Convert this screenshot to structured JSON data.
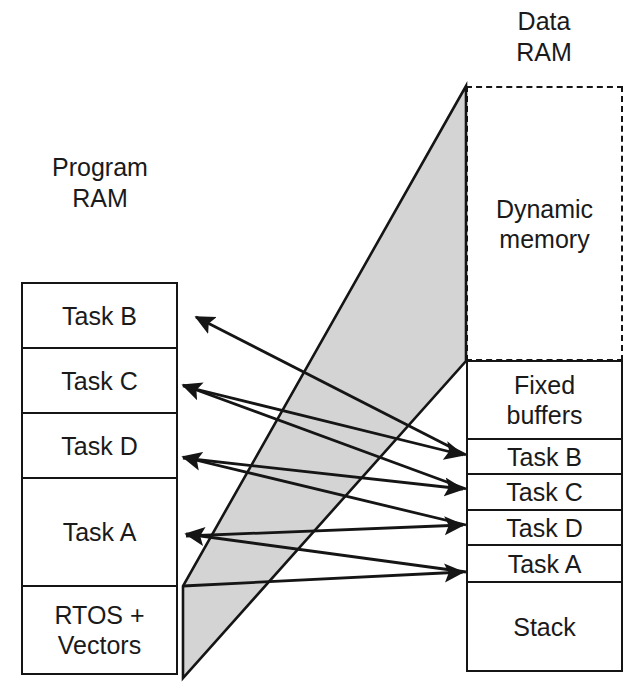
{
  "diagram": {
    "background": "#ffffff",
    "wedge_fill": "#d4d4d4",
    "line_color": "#151515",
    "text_color": "#1a1a1a"
  },
  "left_panel": {
    "caption": "Program\nRAM",
    "blocks": [
      {
        "label": "Task B"
      },
      {
        "label": "Task C"
      },
      {
        "label": "Task D"
      },
      {
        "label": "Task A"
      },
      {
        "label": "RTOS +\nVectors"
      }
    ]
  },
  "right_panel": {
    "caption": "Data\nRAM",
    "dynamic_block": {
      "label": "Dynamic\nmemory",
      "border_style": "dashed"
    },
    "blocks": [
      {
        "label": "Fixed\nbuffers"
      },
      {
        "label": "Task B"
      },
      {
        "label": "Task C"
      },
      {
        "label": "Task D"
      },
      {
        "label": "Task A"
      },
      {
        "label": "Stack"
      }
    ]
  },
  "connections": [
    {
      "from": "right.Task B",
      "to": "left.Task B",
      "direction": "right-to-left"
    },
    {
      "from": "right.Task C",
      "to": "left.Task C",
      "direction": "right-to-left"
    },
    {
      "from": "right.Task D",
      "to": "left.Task D",
      "direction": "right-to-left"
    },
    {
      "from": "right.Task A",
      "to": "left.Task A",
      "direction": "right-to-left"
    },
    {
      "from": "left.Task B",
      "to": "right.Task B",
      "direction": "left-to-right"
    },
    {
      "from": "left.Task C",
      "to": "right.Task C",
      "direction": "left-to-right"
    },
    {
      "from": "left.Task D",
      "to": "right.Task D",
      "direction": "left-to-right"
    },
    {
      "from": "left.Task A",
      "to": "right.Task A",
      "direction": "left-to-right"
    }
  ]
}
